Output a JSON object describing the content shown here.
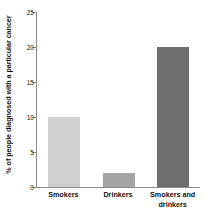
{
  "chart_data": {
    "type": "bar",
    "title": "",
    "subtitle": "",
    "xlabel": "",
    "ylabel": "% of people diagnosed with a particular cancer",
    "ylim": [
      0,
      25
    ],
    "yticks": [
      0,
      5,
      10,
      15,
      20,
      25
    ],
    "ytick_labels": [
      "0",
      "5",
      "10",
      "15",
      "20",
      "25"
    ],
    "grid": false,
    "legend": false,
    "legend_position": "none",
    "categories": [
      "Smokers",
      "Drinkers",
      "Smokers and drinkers"
    ],
    "category_label_lines": [
      [
        "Smokers"
      ],
      [
        "Drinkers"
      ],
      [
        "Smokers and",
        "drinkers"
      ]
    ],
    "values": [
      10,
      2,
      20
    ],
    "bar_colors": [
      "#d0d0d0",
      "#a3a3a3",
      "#6e6e6e"
    ],
    "axis_color": "#8a8a8a",
    "text_color": "#111111",
    "background": "#ffffff"
  }
}
